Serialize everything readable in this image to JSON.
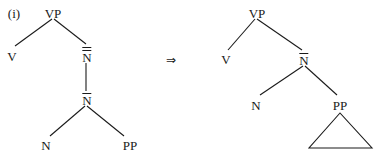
{
  "example_label": "(i)",
  "arrow": "⇒",
  "left_tree": {
    "root": "VP",
    "v": "V",
    "n_double_bar": "N",
    "n_bar": "N",
    "n": "N",
    "pp": "PP"
  },
  "right_tree": {
    "root": "VP",
    "v": "V",
    "n_bar": "N",
    "n": "N",
    "pp": "PP",
    "pp_content": "triangle"
  },
  "colors": {
    "ink": "#1a1a1a",
    "background": "#ffffff"
  }
}
